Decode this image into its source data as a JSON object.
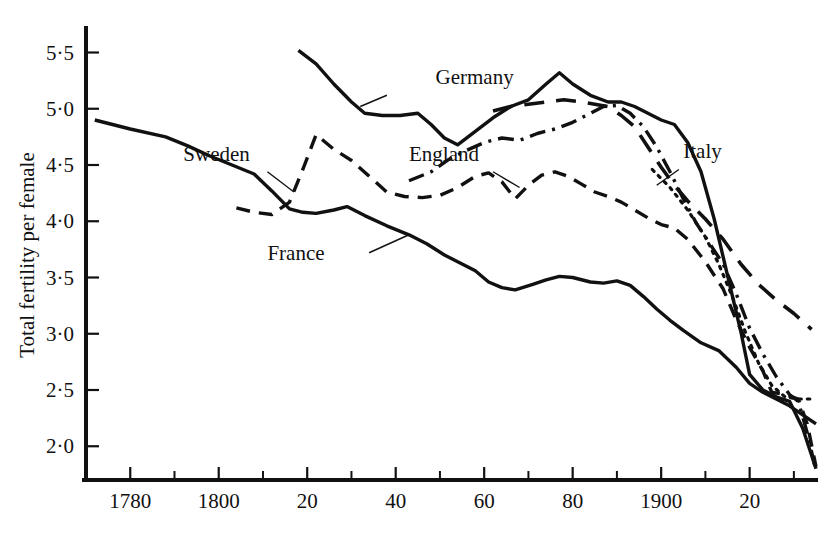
{
  "chart_data": {
    "type": "line",
    "title": "",
    "xlabel": "",
    "ylabel": "Total fertility per female",
    "xlim": [
      1770,
      1935
    ],
    "ylim": [
      1.7,
      5.7
    ],
    "grid": false,
    "legend_position": "inline-annotations",
    "y_ticks": [
      "5·5",
      "5·0",
      "4·5",
      "4·0",
      "3·5",
      "3·0",
      "2·5",
      "2·0"
    ],
    "y_tick_values": [
      5.5,
      5.0,
      4.5,
      4.0,
      3.5,
      3.0,
      2.5,
      2.0
    ],
    "x_ticks": [
      "1780",
      "1800",
      "20",
      "40",
      "60",
      "80",
      "1900",
      "20"
    ],
    "x_tick_values": [
      1780,
      1800,
      1820,
      1840,
      1860,
      1880,
      1900,
      1920
    ],
    "x_minor_tick_values": [
      1790,
      1810,
      1830,
      1850,
      1870,
      1890,
      1910,
      1930
    ],
    "series": [
      {
        "name": "France",
        "style": "solid",
        "label": "France",
        "label_x": 1811,
        "label_y": 3.66,
        "leader_from": [
          1834,
          3.72
        ],
        "leader_to": [
          1843,
          3.88
        ],
        "points": [
          [
            1772,
            4.9
          ],
          [
            1780,
            4.82
          ],
          [
            1788,
            4.75
          ],
          [
            1793,
            4.67
          ],
          [
            1798,
            4.58
          ],
          [
            1803,
            4.5
          ],
          [
            1808,
            4.42
          ],
          [
            1812,
            4.27
          ],
          [
            1816,
            4.11
          ],
          [
            1819,
            4.08
          ],
          [
            1822,
            4.07
          ],
          [
            1826,
            4.1
          ],
          [
            1829,
            4.13
          ],
          [
            1833,
            4.05
          ],
          [
            1838,
            3.96
          ],
          [
            1843,
            3.88
          ],
          [
            1847,
            3.8
          ],
          [
            1851,
            3.7
          ],
          [
            1855,
            3.62
          ],
          [
            1858,
            3.56
          ],
          [
            1861,
            3.46
          ],
          [
            1864,
            3.41
          ],
          [
            1867,
            3.39
          ],
          [
            1871,
            3.44
          ],
          [
            1874,
            3.48
          ],
          [
            1877,
            3.51
          ],
          [
            1880,
            3.5
          ],
          [
            1884,
            3.46
          ],
          [
            1887,
            3.45
          ],
          [
            1890,
            3.47
          ],
          [
            1893,
            3.43
          ],
          [
            1896,
            3.33
          ],
          [
            1899,
            3.22
          ],
          [
            1902,
            3.12
          ],
          [
            1905,
            3.03
          ],
          [
            1909,
            2.92
          ],
          [
            1913,
            2.85
          ],
          [
            1917,
            2.7
          ],
          [
            1920,
            2.56
          ],
          [
            1923,
            2.48
          ],
          [
            1926,
            2.42
          ],
          [
            1929,
            2.36
          ],
          [
            1932,
            2.28
          ],
          [
            1935,
            2.2
          ]
        ]
      },
      {
        "name": "Sweden",
        "style": "dashed",
        "label": "Sweden",
        "label_x": 1792,
        "label_y": 4.54,
        "leader_from": [
          1811,
          4.44
        ],
        "leader_to": [
          1817,
          4.26
        ],
        "points": [
          [
            1804,
            4.12
          ],
          [
            1808,
            4.08
          ],
          [
            1812,
            4.06
          ],
          [
            1816,
            4.17
          ],
          [
            1819,
            4.46
          ],
          [
            1822,
            4.77
          ],
          [
            1826,
            4.64
          ],
          [
            1830,
            4.54
          ],
          [
            1834,
            4.4
          ],
          [
            1838,
            4.26
          ],
          [
            1842,
            4.22
          ],
          [
            1846,
            4.21
          ],
          [
            1850,
            4.23
          ],
          [
            1854,
            4.3
          ],
          [
            1858,
            4.4
          ],
          [
            1861,
            4.43
          ],
          [
            1864,
            4.35
          ],
          [
            1867,
            4.2
          ],
          [
            1870,
            4.32
          ],
          [
            1873,
            4.41
          ],
          [
            1876,
            4.44
          ],
          [
            1879,
            4.4
          ],
          [
            1882,
            4.33
          ],
          [
            1885,
            4.26
          ],
          [
            1888,
            4.22
          ],
          [
            1891,
            4.17
          ],
          [
            1894,
            4.1
          ],
          [
            1897,
            4.03
          ],
          [
            1900,
            3.97
          ],
          [
            1903,
            3.94
          ],
          [
            1906,
            3.84
          ],
          [
            1910,
            3.64
          ],
          [
            1914,
            3.4
          ],
          [
            1917,
            3.12
          ],
          [
            1920,
            2.88
          ],
          [
            1923,
            2.67
          ],
          [
            1925,
            2.48
          ],
          [
            1928,
            2.46
          ],
          [
            1931,
            2.42
          ],
          [
            1933,
            2.2
          ],
          [
            1935,
            1.82
          ]
        ]
      },
      {
        "name": "England",
        "style": "dashdot",
        "label": "England",
        "label_x": 1843,
        "label_y": 4.54,
        "leader_from": [
          1862,
          4.44
        ],
        "leader_to": [
          1868,
          4.3
        ],
        "points": [
          [
            1843,
            4.36
          ],
          [
            1848,
            4.44
          ],
          [
            1852,
            4.55
          ],
          [
            1856,
            4.63
          ],
          [
            1860,
            4.7
          ],
          [
            1864,
            4.74
          ],
          [
            1868,
            4.72
          ],
          [
            1872,
            4.78
          ],
          [
            1876,
            4.82
          ],
          [
            1880,
            4.88
          ],
          [
            1884,
            4.96
          ],
          [
            1887,
            5.02
          ],
          [
            1890,
            5.03
          ],
          [
            1893,
            4.96
          ],
          [
            1896,
            4.84
          ],
          [
            1899,
            4.66
          ],
          [
            1902,
            4.44
          ],
          [
            1905,
            4.2
          ],
          [
            1908,
            3.98
          ],
          [
            1911,
            3.8
          ],
          [
            1914,
            3.62
          ],
          [
            1917,
            3.35
          ],
          [
            1920,
            3.05
          ],
          [
            1923,
            2.82
          ],
          [
            1926,
            2.62
          ],
          [
            1929,
            2.46
          ],
          [
            1931,
            2.4
          ],
          [
            1933,
            2.12
          ],
          [
            1935,
            1.78
          ]
        ]
      },
      {
        "name": "Germany",
        "style": "solid",
        "label": "Germany",
        "label_x": 1849,
        "label_y": 5.22,
        "leader_from": [
          1838,
          5.12
        ],
        "leader_to": [
          1832,
          5.02
        ],
        "points": [
          [
            1818,
            5.52
          ],
          [
            1822,
            5.4
          ],
          [
            1826,
            5.22
          ],
          [
            1830,
            5.06
          ],
          [
            1833,
            4.96
          ],
          [
            1837,
            4.94
          ],
          [
            1841,
            4.94
          ],
          [
            1845,
            4.96
          ],
          [
            1848,
            4.86
          ],
          [
            1851,
            4.74
          ],
          [
            1854,
            4.68
          ],
          [
            1858,
            4.8
          ],
          [
            1862,
            4.92
          ],
          [
            1866,
            5.02
          ],
          [
            1870,
            5.08
          ],
          [
            1874,
            5.22
          ],
          [
            1877,
            5.32
          ],
          [
            1880,
            5.22
          ],
          [
            1884,
            5.12
          ],
          [
            1888,
            5.06
          ],
          [
            1891,
            5.06
          ],
          [
            1894,
            5.02
          ],
          [
            1897,
            4.96
          ],
          [
            1900,
            4.9
          ],
          [
            1903,
            4.86
          ],
          [
            1906,
            4.7
          ],
          [
            1909,
            4.44
          ],
          [
            1912,
            4.02
          ],
          [
            1915,
            3.52
          ],
          [
            1918,
            3.02
          ],
          [
            1920,
            2.64
          ],
          [
            1923,
            2.5
          ],
          [
            1926,
            2.44
          ],
          [
            1929,
            2.4
          ],
          [
            1932,
            2.16
          ],
          [
            1935,
            1.8
          ]
        ]
      },
      {
        "name": "Italy",
        "style": "longdash",
        "label": "Italy",
        "label_x": 1905,
        "label_y": 4.56,
        "leader_from": [
          1904,
          4.46
        ],
        "leader_to": [
          1899,
          4.32
        ],
        "points": [
          [
            1862,
            4.98
          ],
          [
            1866,
            5.02
          ],
          [
            1870,
            5.04
          ],
          [
            1874,
            5.06
          ],
          [
            1878,
            5.08
          ],
          [
            1882,
            5.06
          ],
          [
            1885,
            5.04
          ],
          [
            1888,
            5.02
          ],
          [
            1891,
            4.94
          ],
          [
            1894,
            4.84
          ],
          [
            1897,
            4.66
          ],
          [
            1900,
            4.48
          ],
          [
            1903,
            4.32
          ],
          [
            1906,
            4.18
          ],
          [
            1910,
            4.02
          ],
          [
            1914,
            3.84
          ],
          [
            1918,
            3.62
          ],
          [
            1922,
            3.44
          ],
          [
            1926,
            3.3
          ],
          [
            1930,
            3.18
          ],
          [
            1934,
            3.04
          ]
        ]
      },
      {
        "name": "dotted-series",
        "style": "dotted",
        "label": "",
        "points": [
          [
            1898,
            4.46
          ],
          [
            1902,
            4.3
          ],
          [
            1906,
            4.1
          ],
          [
            1910,
            3.86
          ],
          [
            1913,
            3.62
          ],
          [
            1916,
            3.34
          ],
          [
            1919,
            3.02
          ],
          [
            1922,
            2.74
          ],
          [
            1925,
            2.54
          ],
          [
            1928,
            2.44
          ],
          [
            1931,
            2.42
          ],
          [
            1934,
            2.42
          ]
        ]
      }
    ]
  }
}
